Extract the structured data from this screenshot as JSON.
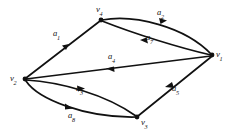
{
  "figure": {
    "type": "directed-graph",
    "background_color": "#ffffff",
    "ink_color": "#111111",
    "label_color": "#131313"
  },
  "vertices": [
    {
      "id": "v1",
      "base": "v",
      "sub": "1",
      "x": 212,
      "y": 55,
      "label_x": 216,
      "label_y": 50
    },
    {
      "id": "v2",
      "base": "v",
      "sub": "2",
      "x": 25,
      "y": 79,
      "label_x": 10,
      "label_y": 74
    },
    {
      "id": "v3",
      "base": "v",
      "sub": "3",
      "x": 137,
      "y": 117,
      "label_x": 141,
      "label_y": 118
    },
    {
      "id": "v4",
      "base": "v",
      "sub": "4",
      "x": 101,
      "y": 20,
      "label_x": 96,
      "label_y": 5
    }
  ],
  "arcs": [
    {
      "id": "a1",
      "base": "a",
      "sub": "1",
      "from": "v2",
      "to": "v4",
      "label_x": 53,
      "label_y": 29,
      "shape": "straight"
    },
    {
      "id": "a2",
      "base": "a",
      "sub": "2",
      "from": "v4",
      "to": "v1",
      "label_x": 157,
      "label_y": 8,
      "shape": "curve-upper"
    },
    {
      "id": "a7",
      "base": "a",
      "sub": "7",
      "from": "v1",
      "to": "v4",
      "label_x": 146,
      "label_y": 33,
      "shape": "curve-lower"
    },
    {
      "id": "a4",
      "base": "a",
      "sub": "4",
      "from": "v1",
      "to": "v2",
      "label_x": 108,
      "label_y": 52,
      "shape": "straight"
    },
    {
      "id": "a5",
      "base": "a",
      "sub": "5",
      "from": "v1",
      "to": "v3",
      "label_x": 172,
      "label_y": 84,
      "shape": "straight"
    },
    {
      "id": "a3",
      "base": "a",
      "sub": "3",
      "from": "v2",
      "to": "v3",
      "label_x": 76,
      "label_y": 84,
      "shape": "curve-upper"
    },
    {
      "id": "a8",
      "base": "a",
      "sub": "8",
      "from": "v2",
      "to": "v3",
      "label_x": 68,
      "label_y": 111,
      "shape": "curve-lower"
    }
  ]
}
